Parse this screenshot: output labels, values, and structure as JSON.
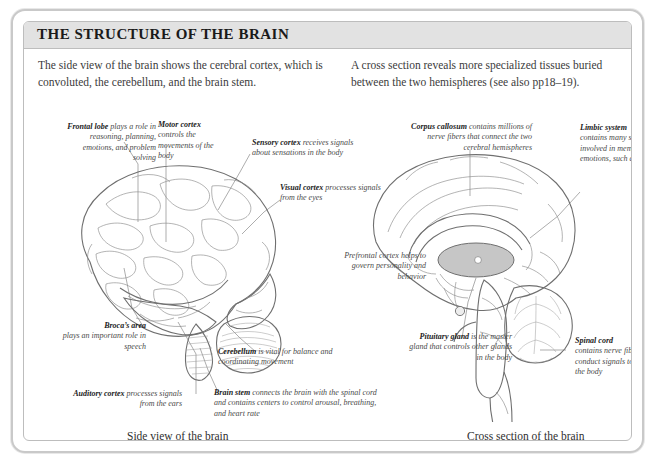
{
  "card": {
    "title": "THE STRUCTURE OF THE BRAIN"
  },
  "intro": {
    "left": "The side view of the brain shows the cerebral cortex, which is convoluted, the cerebellum, and the brain stem.",
    "right": "A cross section reveals more specialized tissues buried between the two hemispheres (see also pp18–19)."
  },
  "captions": {
    "left": "Side view of the brain",
    "right": "Cross section of the brain"
  },
  "side_view_labels": {
    "frontal_lobe": {
      "term": "Frontal lobe",
      "text": " plays a role in reasoning, planning, emotions, and problem solving"
    },
    "motor_cortex": {
      "term": "Motor cortex",
      "text": "controls the movements of the body"
    },
    "sensory_cortex": {
      "term": "Sensory cortex",
      "text": " receives signals about sensations in the body"
    },
    "visual_cortex": {
      "term": "Visual cortex",
      "text": " processes signals from the eyes"
    },
    "brocas_area": {
      "term": "Broca’s area",
      "text": "plays an important role in speech"
    },
    "auditory_cortex": {
      "term": "Auditory cortex",
      "text": " processes signals from the ears"
    },
    "cerebellum": {
      "term": "Cerebellum",
      "text": " is vital for balance and coordinating movement"
    },
    "brain_stem": {
      "term": "Brain stem",
      "text": " connects the brain with the spinal cord and contains centers to control arousal, breathing, and heart rate"
    }
  },
  "cross_section_labels": {
    "corpus_callosum": {
      "term": "Corpus callosum",
      "text": " contains millions of nerve fibers that connect the two cerebral hemispheres"
    },
    "limbic_system": {
      "term": "Limbic system",
      "text": "contains many structures involved in memory and emotions, such as fear"
    },
    "prefrontal_cortex": {
      "term": "",
      "text": "Prefrontal cortex helps to govern personality and behavior"
    },
    "pituitary_gland": {
      "term": "Pituitary gland",
      "text": " is the master gland that controls other glands in the body"
    },
    "spinal_cord": {
      "term": "Spinal cord",
      "text": "contains nerve fibers that conduct signals to and from the body"
    }
  },
  "colors": {
    "card_border": "#c9c9c9",
    "title_band": "#e2e2e2",
    "brain_fill": "#d4d4d4",
    "brain_outline": "#6f6f6f",
    "text": "#3b3b3b",
    "label_term": "#1c1c1c"
  }
}
